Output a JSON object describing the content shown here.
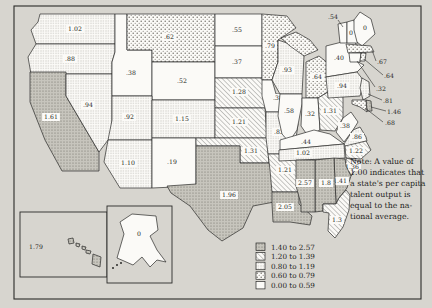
{
  "figure": {
    "kind": "choropleth-map-scan",
    "paper_color": "#d7d5cf",
    "ink_color": "#2a2a28",
    "white_color": "#fbfaf7",
    "gray_fill": "#c7c5bd"
  },
  "note": {
    "lines": [
      "Note: A value of",
      "1.00 indicates that",
      "a state's per capita",
      "talent output is",
      "equal to the na-",
      "tional average."
    ]
  },
  "legend": {
    "items": [
      {
        "range": "1.40 to 2.57",
        "bin": "b1"
      },
      {
        "range": "1.20 to 1.39",
        "bin": "b2"
      },
      {
        "range": "0.80 to 1.19",
        "bin": "b3"
      },
      {
        "range": "0.60 to 0.79",
        "bin": "b4"
      },
      {
        "range": "0.00 to 0.59",
        "bin": "b5"
      }
    ],
    "thresholds": {
      "b1": 1.4,
      "b2": 1.2,
      "b3": 0.8,
      "b4": 0.6
    }
  },
  "states": [
    {
      "id": "WA",
      "value": "1.02"
    },
    {
      "id": "OR",
      "value": ".88"
    },
    {
      "id": "CA",
      "value": "1.61"
    },
    {
      "id": "NV",
      "value": ".94"
    },
    {
      "id": "ID",
      "value": ".38"
    },
    {
      "id": "MT",
      "value": ".62"
    },
    {
      "id": "WY",
      "value": ".52"
    },
    {
      "id": "UT",
      "value": ".92"
    },
    {
      "id": "CO",
      "value": "1.15"
    },
    {
      "id": "AZ",
      "value": "1.10"
    },
    {
      "id": "NM",
      "value": ".19"
    },
    {
      "id": "ND",
      "value": ".55"
    },
    {
      "id": "SD",
      "value": ".37"
    },
    {
      "id": "NE",
      "value": "1.28"
    },
    {
      "id": "KS",
      "value": "1.21"
    },
    {
      "id": "OK",
      "value": "1.31"
    },
    {
      "id": "TX",
      "value": "1.96"
    },
    {
      "id": "MN",
      "value": ".79"
    },
    {
      "id": "IA",
      "value": ".38"
    },
    {
      "id": "MO",
      "value": ".83"
    },
    {
      "id": "AR",
      "value": "1.21"
    },
    {
      "id": "LA",
      "value": "2.05"
    },
    {
      "id": "WI",
      "value": ".93"
    },
    {
      "id": "MI",
      "value": ".64"
    },
    {
      "id": "IL",
      "value": ".58"
    },
    {
      "id": "IN",
      "value": ".32"
    },
    {
      "id": "OH",
      "value": "1.31"
    },
    {
      "id": "KY",
      "value": ".44"
    },
    {
      "id": "WV",
      "value": ".38"
    },
    {
      "id": "VA",
      "value": ".86"
    },
    {
      "id": "TN",
      "value": "1.02"
    },
    {
      "id": "NC",
      "value": "1.22"
    },
    {
      "id": "SC",
      "value": "1.36"
    },
    {
      "id": "GA",
      "value": "1.41"
    },
    {
      "id": "AL",
      "value": "1.8"
    },
    {
      "id": "MS",
      "value": "2.57"
    },
    {
      "id": "FL",
      "value": "1.3"
    },
    {
      "id": "NY",
      "value": ".40"
    },
    {
      "id": "PA",
      "value": ".94"
    },
    {
      "id": "NJ",
      "value": ".81"
    },
    {
      "id": "DE",
      "value": "1.46"
    },
    {
      "id": "MD",
      "value": ".68"
    },
    {
      "id": "VT",
      "value": ".54"
    },
    {
      "id": "NH",
      "value": "0"
    },
    {
      "id": "ME",
      "value": "0"
    },
    {
      "id": "MA",
      "value": ".67"
    },
    {
      "id": "CT",
      "value": ".32"
    },
    {
      "id": "RI",
      "value": ".64"
    },
    {
      "id": "HI",
      "value": "1.79"
    },
    {
      "id": "AK",
      "value": "0"
    }
  ]
}
